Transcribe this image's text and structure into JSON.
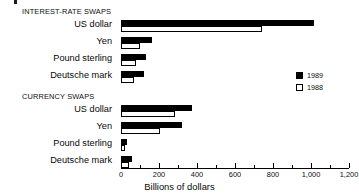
{
  "chart_data": {
    "type": "bar",
    "orientation": "horizontal",
    "title": "",
    "xlabel": "Billions of dollars",
    "ylabel": "",
    "xlim": [
      0,
      1200
    ],
    "xticks": [
      0,
      200,
      400,
      600,
      800,
      1000,
      1200
    ],
    "xtick_labels": [
      "0",
      "200",
      "400",
      "600",
      "800",
      "1,000",
      "1,200"
    ],
    "minor_tick_step": 100,
    "grid": false,
    "legend_position": "right",
    "series": [
      {
        "name": "1989",
        "style": "filled",
        "color": "#000000"
      },
      {
        "name": "1988",
        "style": "open",
        "color": "#ffffff"
      }
    ],
    "groups": [
      {
        "title": "INTEREST-RATE SWAPS",
        "categories": [
          "US dollar",
          "Yen",
          "Pound sterling",
          "Deutsche mark"
        ],
        "values_1989": [
          1015,
          165,
          130,
          120
        ],
        "values_1988": [
          740,
          100,
          80,
          70
        ]
      },
      {
        "title": "CURRENCY SWAPS",
        "categories": [
          "US dollar",
          "Yen",
          "Pound sterling",
          "Deutsche mark"
        ],
        "values_1989": [
          375,
          320,
          30,
          60
        ],
        "values_1988": [
          285,
          205,
          20,
          40
        ]
      }
    ]
  }
}
